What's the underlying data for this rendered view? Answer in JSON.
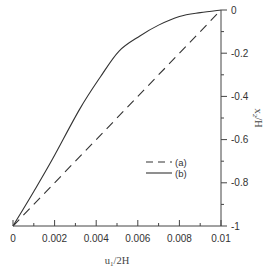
{
  "chart_data": {
    "type": "line",
    "title": "",
    "xlabel": "u1/2H",
    "ylabel": "x2/H",
    "xlim": [
      0,
      0.01
    ],
    "ylim": [
      -1,
      0
    ],
    "x_ticks": [
      "0",
      "0.002",
      "0.004",
      "0.006",
      "0.008",
      "0.01"
    ],
    "y_ticks": [
      "0",
      "-0.2",
      "-0.4",
      "-0.6",
      "-0.8",
      "-1"
    ],
    "y_axis_position": "right",
    "grid": false,
    "legend_position": "center-right",
    "series": [
      {
        "name": "(a)",
        "style": "dashed",
        "x": [
          0,
          0.002,
          0.004,
          0.006,
          0.008,
          0.01
        ],
        "y": [
          -1,
          -0.8,
          -0.6,
          -0.4,
          -0.2,
          0
        ]
      },
      {
        "name": "(b)",
        "style": "solid",
        "x": [
          0,
          0.001,
          0.0019,
          0.0032,
          0.0042,
          0.0051,
          0.0061,
          0.007,
          0.008,
          0.009,
          0.01
        ],
        "y": [
          -1,
          -0.84,
          -0.69,
          -0.46,
          -0.31,
          -0.19,
          -0.12,
          -0.07,
          -0.03,
          -0.012,
          0
        ]
      }
    ]
  },
  "axes": {
    "xlabel_main": "u",
    "xlabel_sub": "1",
    "xlabel_rest": "/2H",
    "ylabel_main": "x",
    "ylabel_sub": "2",
    "ylabel_rest": "/H"
  },
  "legend": {
    "a_label": "(a)",
    "b_label": "(b)"
  },
  "colors": {
    "line": "#333333",
    "axis": "#444444"
  }
}
